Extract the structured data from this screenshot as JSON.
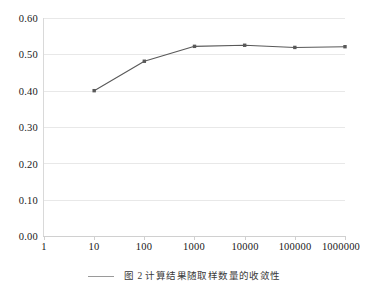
{
  "chart_data": {
    "type": "line",
    "title": "",
    "subtitle": "",
    "xlabel": "",
    "ylabel": "",
    "xscale": "log",
    "x": [
      1,
      10,
      100,
      1000,
      10000,
      100000,
      1000000
    ],
    "x_tick_labels": [
      "1",
      "10",
      "100",
      "1000",
      "10000",
      "100000",
      "1000000"
    ],
    "y_tick_labels": [
      "0.60",
      "0.50",
      "0.40",
      "0.30",
      "0.20",
      "0.10",
      "0.00"
    ],
    "y_tick_values": [
      0.6,
      0.5,
      0.4,
      0.3,
      0.2,
      0.1,
      0.0
    ],
    "ylim": [
      0.0,
      0.6
    ],
    "grid": "horizontal",
    "legend": "none",
    "series": [
      {
        "name": "series-1",
        "marker": "square",
        "color": "#595959",
        "points": [
          {
            "x": 10,
            "y": 0.4
          },
          {
            "x": 100,
            "y": 0.481
          },
          {
            "x": 1000,
            "y": 0.522
          },
          {
            "x": 10000,
            "y": 0.525
          },
          {
            "x": 100000,
            "y": 0.519
          },
          {
            "x": 1000000,
            "y": 0.521
          }
        ]
      }
    ],
    "annotations": []
  },
  "axes": {
    "y_ticks": [
      {
        "label": "0.60",
        "value": 0.6
      },
      {
        "label": "0.50",
        "value": 0.5
      },
      {
        "label": "0.40",
        "value": 0.4
      },
      {
        "label": "0.30",
        "value": 0.3
      },
      {
        "label": "0.20",
        "value": 0.2
      },
      {
        "label": "0.10",
        "value": 0.1
      },
      {
        "label": "0.00",
        "value": 0.0
      }
    ],
    "x_ticks": [
      {
        "label": "1",
        "index": 0
      },
      {
        "label": "10",
        "index": 1
      },
      {
        "label": "100",
        "index": 2
      },
      {
        "label": "1000",
        "index": 3
      },
      {
        "label": "10000",
        "index": 4
      },
      {
        "label": "100000",
        "index": 5
      },
      {
        "label": "1000000",
        "index": 6
      }
    ]
  },
  "caption": {
    "text": "图 2  计算结果随取样数量的收敛性"
  },
  "colors": {
    "series": "#595959",
    "gridline": "#e8e8e8",
    "axis": "#d0d0d0",
    "text": "#202020",
    "background": "#ffffff"
  }
}
